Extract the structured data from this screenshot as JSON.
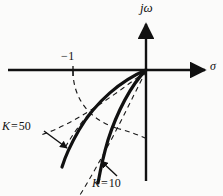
{
  "figure": {
    "kind": "root-locus-s-plane",
    "background_color": "#fbfbfa",
    "ink_color": "#111111"
  },
  "axes": {
    "vertical_label": "jω",
    "horizontal_label": "σ",
    "origin_px": [
      146,
      70
    ],
    "horizontal_axis": {
      "x_start": 8,
      "x_end": 212,
      "y": 70
    },
    "vertical_axis": {
      "x": 146,
      "y_top": 18,
      "y_bottom": 181
    },
    "tick": {
      "label": "−1",
      "x": 73,
      "y": 70
    }
  },
  "annotations": [
    {
      "name": "k-50",
      "k_symbol": "K",
      "equals": "=",
      "value": "50",
      "label": "K = 50",
      "arrow_from": [
        44,
        131
      ],
      "arrow_to": [
        67,
        148
      ]
    },
    {
      "name": "k-10",
      "k_symbol": "K",
      "equals": "=",
      "value": "10",
      "label": "K = 10",
      "arrow_from": [
        117,
        176
      ],
      "arrow_to": [
        101,
        161
      ]
    }
  ],
  "chart_data": {
    "type": "line",
    "title": "",
    "xlabel": "σ",
    "ylabel": "jω",
    "xlim": [
      -2.3,
      0.78
    ],
    "ylim": [
      -1.72,
      0.78
    ],
    "grid": false,
    "legend": "inline-arrow-labels",
    "axis_origin_px": [
      146,
      70
    ],
    "px_per_unit": 60,
    "marked_points": [
      {
        "label": "−1",
        "x": -1.22,
        "y": 0
      }
    ],
    "series": [
      {
        "name": "K = 50",
        "style": "solid-thick",
        "color": "#111111",
        "width_px": 3.2,
        "points_px": [
          [
            146,
            70
          ],
          [
            132,
            75
          ],
          [
            120,
            81
          ],
          [
            110,
            88
          ],
          [
            101,
            96
          ],
          [
            93,
            105
          ],
          [
            86,
            115
          ],
          [
            80,
            126
          ],
          [
            74,
            137
          ],
          [
            69,
            148
          ],
          [
            65,
            158
          ],
          [
            62,
            166
          ]
        ]
      },
      {
        "name": "K = 10",
        "style": "solid-thick",
        "color": "#111111",
        "width_px": 3.2,
        "points_px": [
          [
            146,
            70
          ],
          [
            138,
            76
          ],
          [
            131,
            84
          ],
          [
            125,
            93
          ],
          [
            119,
            104
          ],
          [
            114,
            116
          ],
          [
            110,
            128
          ],
          [
            106,
            140
          ],
          [
            103,
            152
          ],
          [
            101,
            163
          ],
          [
            99,
            173
          ],
          [
            98,
            181
          ]
        ]
      },
      {
        "name": "constant-wn-arc-1",
        "style": "dashed-thin",
        "color": "#1a1a1a",
        "width_px": 1.1,
        "points_px": [
          [
            73,
            72
          ],
          [
            74,
            83
          ],
          [
            77,
            94
          ],
          [
            82,
            104
          ],
          [
            89,
            113
          ],
          [
            97,
            120
          ],
          [
            106,
            125
          ],
          [
            116,
            128
          ]
        ]
      },
      {
        "name": "constant-wn-arc-2",
        "style": "dashed-thin",
        "color": "#1a1a1a",
        "width_px": 1.1,
        "points_px": [
          [
            116,
            128
          ],
          [
            126,
            130
          ],
          [
            134,
            133
          ],
          [
            141,
            136
          ],
          [
            146,
            138
          ]
        ]
      },
      {
        "name": "asymptote-dashed-upper",
        "style": "dashed-thin",
        "color": "#1a1a1a",
        "width_px": 1.1,
        "points_px": [
          [
            146,
            71
          ],
          [
            133,
            76
          ],
          [
            121,
            82
          ],
          [
            110,
            90
          ],
          [
            100,
            99
          ],
          [
            91,
            109
          ],
          [
            83,
            119
          ],
          [
            76,
            129
          ],
          [
            70,
            138
          ],
          [
            66,
            145
          ]
        ]
      },
      {
        "name": "asymptote-dashed-left",
        "style": "dashed-thin",
        "color": "#1a1a1a",
        "width_px": 1.1,
        "points_px": [
          [
            146,
            71
          ],
          [
            126,
            85
          ],
          [
            108,
            99
          ],
          [
            91,
            112
          ],
          [
            75,
            122
          ],
          [
            62,
            129
          ],
          [
            50,
            133
          ],
          [
            41,
            135
          ]
        ]
      },
      {
        "name": "asymptote-dashed-lower",
        "style": "dashed-thin",
        "color": "#1a1a1a",
        "width_px": 1.1,
        "points_px": [
          [
            146,
            71
          ],
          [
            140,
            80
          ],
          [
            134,
            91
          ],
          [
            128,
            103
          ],
          [
            122,
            116
          ],
          [
            115,
            130
          ],
          [
            108,
            145
          ],
          [
            100,
            160
          ],
          [
            92,
            174
          ],
          [
            85,
            186
          ],
          [
            80,
            194
          ]
        ]
      }
    ]
  }
}
